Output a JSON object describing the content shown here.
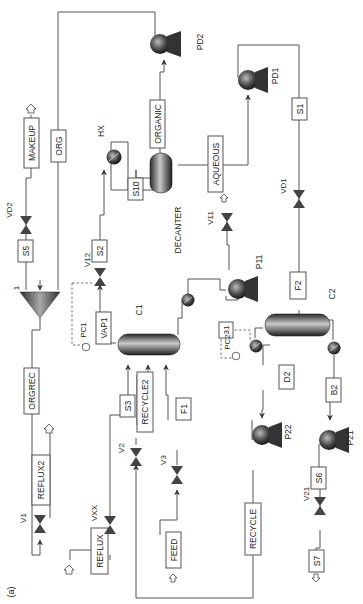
{
  "figure": {
    "panel_label": "(a)",
    "orientation": "rotated 90 degrees (text reads bottom-to-top)"
  },
  "colors": {
    "line": "#555555",
    "equipment_dark": "#2a2a2a",
    "equipment_light": "#bdbdbd",
    "background": "#ffffff"
  },
  "units": {
    "columns": [
      {
        "id": "C1",
        "label": "C1"
      },
      {
        "id": "C2",
        "label": "C2"
      }
    ],
    "decanter": {
      "label": "DECANTER"
    },
    "mixer": {
      "label": "1"
    },
    "heat_exchanger": {
      "label": "HX"
    },
    "pumps": [
      {
        "label": "PD2"
      },
      {
        "label": "PD1"
      },
      {
        "label": "P11"
      },
      {
        "label": "P22"
      },
      {
        "label": "P21"
      }
    ],
    "valves": [
      {
        "label": "VD2"
      },
      {
        "label": "VD1"
      },
      {
        "label": "V12"
      },
      {
        "label": "V11"
      },
      {
        "label": "V1"
      },
      {
        "label": "VXX"
      },
      {
        "label": "V2"
      },
      {
        "label": "V3"
      },
      {
        "label": "V21"
      }
    ],
    "controllers": [
      {
        "label": "PC1"
      },
      {
        "label": "PC2"
      }
    ]
  },
  "streams": {
    "makeup": "MAKEUP",
    "org": "ORG",
    "organic": "ORGANIC",
    "aqueous": "AQUEOUS",
    "s1": "S1",
    "s10": "S10",
    "s5": "S5",
    "s2": "S2",
    "vap1": "VAP1",
    "f2": "F2",
    "s31": "31",
    "orgrec": "ORGREC",
    "reflux2": "REFLUX2",
    "s3": "S3",
    "recycle2": "RECYCLE2",
    "f1": "F1",
    "d2": "D2",
    "b2": "B2",
    "reflux": "REFLUX",
    "feed": "FEED",
    "recycle": "RECYCLE",
    "s6": "S6",
    "s7": "S7"
  }
}
